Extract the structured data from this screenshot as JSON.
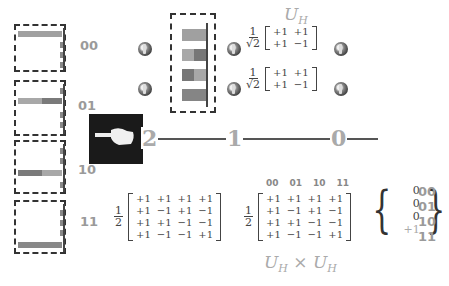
{
  "title": {
    "gate_label": "U",
    "gate_sub": "H",
    "product_label": "U",
    "product_sub": "H",
    "product_op": "×"
  },
  "state_labels": [
    "00",
    "01",
    "10",
    "11"
  ],
  "colors": {
    "bar_light": "#a8a8a8",
    "bar_dark": "#7a7a7a",
    "axis": "#444444",
    "label_gray": "#9a9a9a",
    "dash": "#333333"
  },
  "wire": {
    "labels": [
      "2",
      "1",
      "0"
    ],
    "pointer_icon": "hand-pointer-icon"
  },
  "single_hadamard": {
    "scalar_num": "1",
    "scalar_den": "√2",
    "matrix": [
      "+1",
      "+1",
      "+1",
      "−1"
    ]
  },
  "two_qubit_hadamard": {
    "scalar_num": "1",
    "scalar_den": "2",
    "matrix": [
      "+1",
      "+1",
      "+1",
      "+1",
      "+1",
      "−1",
      "+1",
      "−1",
      "+1",
      "+1",
      "−1",
      "−1",
      "+1",
      "−1",
      "−1",
      "+1"
    ]
  },
  "result": {
    "col_headers": [
      "00",
      "01",
      "10",
      "11"
    ],
    "scalar_num": "1",
    "scalar_den": "2",
    "matrix": [
      "+1",
      "+1",
      "+1",
      "+1",
      "+1",
      "−1",
      "+1",
      "−1",
      "+1",
      "+1",
      "−1",
      "−1",
      "+1",
      "−1",
      "−1",
      "+1"
    ],
    "vector": [
      "0",
      "0",
      "0",
      "+1"
    ],
    "row_labels": [
      "00",
      "01",
      "10",
      "11"
    ]
  }
}
